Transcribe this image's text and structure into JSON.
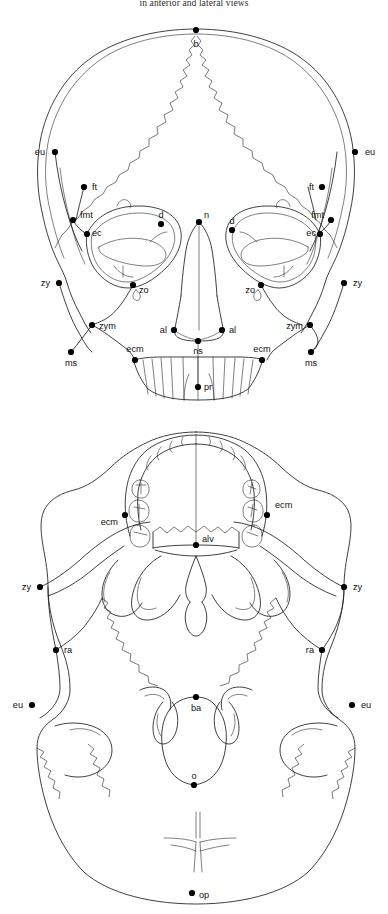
{
  "caption": {
    "top_line": "in anterior and lateral views"
  },
  "colors": {
    "ink": "#1d1d1d",
    "background": "#ffffff",
    "landmark_dot": "#000000"
  },
  "figures": [
    {
      "id": "skull-anterior",
      "name": "anterior-view-skull",
      "view": "anterior",
      "landmarks": [
        {
          "code": "b",
          "x": 196,
          "y": 30,
          "lx": 196,
          "ly": 47,
          "anchor": "middle"
        },
        {
          "code": "eu",
          "x": 55,
          "y": 152,
          "lx": 45,
          "ly": 155,
          "anchor": "end"
        },
        {
          "code": "eu",
          "x": 355,
          "y": 152,
          "lx": 365,
          "ly": 155,
          "anchor": "start"
        },
        {
          "code": "ft",
          "x": 84,
          "y": 187,
          "lx": 92,
          "ly": 190,
          "anchor": "start"
        },
        {
          "code": "ft",
          "x": 322,
          "y": 187,
          "lx": 314,
          "ly": 190,
          "anchor": "end"
        },
        {
          "code": "fmt",
          "x": 73,
          "y": 220,
          "lx": 80,
          "ly": 218,
          "anchor": "start"
        },
        {
          "code": "fmt",
          "x": 331,
          "y": 220,
          "lx": 324,
          "ly": 218,
          "anchor": "end"
        },
        {
          "code": "ec",
          "x": 87,
          "y": 234,
          "lx": 92,
          "ly": 236,
          "anchor": "start"
        },
        {
          "code": "ec",
          "x": 320,
          "y": 234,
          "lx": 316,
          "ly": 236,
          "anchor": "end"
        },
        {
          "code": "d",
          "x": 161,
          "y": 224,
          "lx": 161,
          "ly": 218,
          "anchor": "middle"
        },
        {
          "code": "d",
          "x": 232,
          "y": 230,
          "lx": 232,
          "ly": 224,
          "anchor": "middle"
        },
        {
          "code": "n",
          "x": 199,
          "y": 222,
          "lx": 204,
          "ly": 218,
          "anchor": "start"
        },
        {
          "code": "zy",
          "x": 59,
          "y": 283,
          "lx": 50,
          "ly": 286,
          "anchor": "end"
        },
        {
          "code": "zy",
          "x": 344,
          "y": 283,
          "lx": 353,
          "ly": 286,
          "anchor": "start"
        },
        {
          "code": "zo",
          "x": 133,
          "y": 285,
          "lx": 139,
          "ly": 293,
          "anchor": "start"
        },
        {
          "code": "zo",
          "x": 261,
          "y": 285,
          "lx": 255,
          "ly": 293,
          "anchor": "end"
        },
        {
          "code": "zym",
          "x": 92,
          "y": 325,
          "lx": 99,
          "ly": 329,
          "anchor": "start"
        },
        {
          "code": "zym",
          "x": 310,
          "y": 325,
          "lx": 303,
          "ly": 329,
          "anchor": "end"
        },
        {
          "code": "ms",
          "x": 71,
          "y": 352,
          "lx": 71,
          "ly": 366,
          "anchor": "middle"
        },
        {
          "code": "ms",
          "x": 311,
          "y": 352,
          "lx": 311,
          "ly": 366,
          "anchor": "middle"
        },
        {
          "code": "al",
          "x": 174,
          "y": 330,
          "lx": 167,
          "ly": 333,
          "anchor": "end"
        },
        {
          "code": "al",
          "x": 222,
          "y": 330,
          "lx": 229,
          "ly": 333,
          "anchor": "start"
        },
        {
          "code": "ns",
          "x": 198,
          "y": 341,
          "lx": 198,
          "ly": 354,
          "anchor": "middle"
        },
        {
          "code": "ecm",
          "x": 135,
          "y": 360,
          "lx": 135,
          "ly": 352,
          "anchor": "middle"
        },
        {
          "code": "ecm",
          "x": 262,
          "y": 360,
          "lx": 262,
          "ly": 352,
          "anchor": "middle"
        },
        {
          "code": "pr",
          "x": 198,
          "y": 387,
          "lx": 204,
          "ly": 390,
          "anchor": "start"
        }
      ]
    },
    {
      "id": "skull-basal",
      "name": "basal-view-skull",
      "view": "basal",
      "landmarks": [
        {
          "code": "ecm",
          "x": 125,
          "y": 515,
          "lx": 118,
          "ly": 525,
          "anchor": "end"
        },
        {
          "code": "ecm",
          "x": 267,
          "y": 515,
          "lx": 275,
          "ly": 508,
          "anchor": "start"
        },
        {
          "code": "alv",
          "x": 196,
          "y": 545,
          "lx": 202,
          "ly": 542,
          "anchor": "start"
        },
        {
          "code": "zy",
          "x": 40,
          "y": 587,
          "lx": 31,
          "ly": 590,
          "anchor": "end"
        },
        {
          "code": "zy",
          "x": 344,
          "y": 587,
          "lx": 353,
          "ly": 590,
          "anchor": "start"
        },
        {
          "code": "ra",
          "x": 56,
          "y": 650,
          "lx": 64,
          "ly": 653,
          "anchor": "start"
        },
        {
          "code": "ra",
          "x": 322,
          "y": 650,
          "lx": 314,
          "ly": 653,
          "anchor": "end"
        },
        {
          "code": "eu",
          "x": 32,
          "y": 705,
          "lx": 23,
          "ly": 708,
          "anchor": "end"
        },
        {
          "code": "eu",
          "x": 352,
          "y": 705,
          "lx": 361,
          "ly": 708,
          "anchor": "start"
        },
        {
          "code": "ba",
          "x": 196,
          "y": 697,
          "lx": 196,
          "ly": 711,
          "anchor": "middle"
        },
        {
          "code": "o",
          "x": 194,
          "y": 785,
          "lx": 194,
          "ly": 779,
          "anchor": "middle"
        },
        {
          "code": "op",
          "x": 192,
          "y": 893,
          "lx": 199,
          "ly": 898,
          "anchor": "start"
        }
      ]
    }
  ],
  "landmark_glossary": {
    "b": "bregma",
    "eu": "euryon",
    "ft": "frontotemporale",
    "fmt": "frontomalare temporale",
    "ec": "ectoconchion",
    "d": "dacryon",
    "n": "nasion",
    "zy": "zygion",
    "zo": "zygoorbitale",
    "zym": "zygomaxillare",
    "ms": "mastoidale",
    "al": "alare",
    "ns": "nasospinale",
    "ecm": "ectomolare",
    "pr": "prosthion",
    "alv": "alveolon",
    "ra": "radiculare",
    "ba": "basion",
    "o": "opisthion",
    "op": "opisthocranion"
  }
}
